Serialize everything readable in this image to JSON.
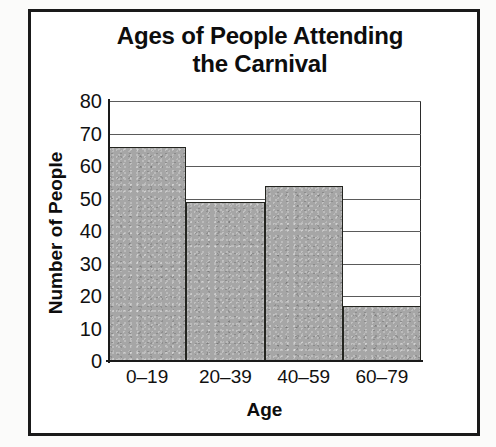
{
  "chart_data": {
    "type": "bar",
    "title": "Ages of People Attending the Carnival",
    "title_line1": "Ages of People Attending",
    "title_line2": "the Carnival",
    "xlabel": "Age",
    "ylabel": "Number of People",
    "categories": [
      "0–19",
      "20–39",
      "40–59",
      "60–79"
    ],
    "values": [
      66,
      49,
      54,
      17
    ],
    "ylim": [
      0,
      80
    ],
    "ytick_labels": [
      "80",
      "70",
      "60",
      "50",
      "40",
      "30",
      "20",
      "10",
      "0"
    ],
    "ytick_values": [
      80,
      70,
      60,
      50,
      40,
      30,
      20,
      10,
      0
    ],
    "ystep": 10,
    "grid": "horizontal",
    "legend": "none",
    "bar_fill_color": "#a6a6a6",
    "bar_edge_color": "#23241f",
    "background_color": "#ffffff",
    "frame_color": "#1a1a1a",
    "text_color": "#0d0d0d",
    "bars_touching": true
  }
}
